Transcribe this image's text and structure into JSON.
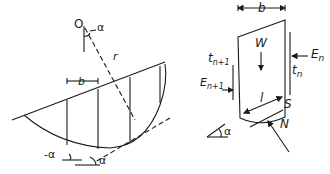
{
  "diagram": {
    "left_panel": {
      "center_label": "O",
      "angle_label": "α",
      "radius_label": "r",
      "slice_width_label": "b",
      "negative_angle_label": "-α",
      "base_angle_label": "α"
    },
    "right_panel": {
      "slice_width_label": "b",
      "weight_label": "W",
      "shear_right_label": "t",
      "shear_right_sub": "n",
      "normal_right_label": "E",
      "normal_right_sub": "n",
      "shear_left_label": "t",
      "shear_left_sub": "n+1",
      "normal_left_label": "E",
      "normal_left_sub": "n+1",
      "base_length_label": "l",
      "shear_base_label": "S",
      "normal_base_label": "N",
      "angle_label": "α"
    },
    "colors": {
      "line": "#1a1a1a",
      "background": "#ffffff"
    }
  }
}
